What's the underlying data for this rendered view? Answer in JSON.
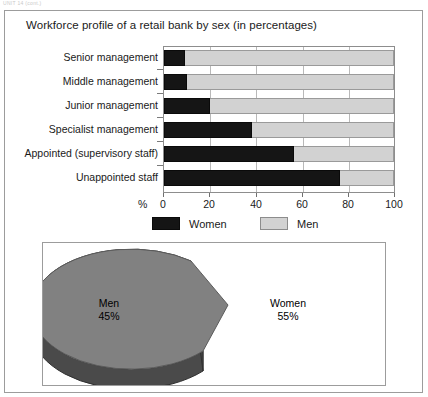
{
  "page": {
    "cut_off_header": "UNIT 14 (cont.)"
  },
  "figure": {
    "title": "Workforce profile of a retail bank by sex (in percentages)"
  },
  "chart_data": [
    {
      "type": "bar",
      "orientation": "horizontal",
      "stacked": true,
      "title": "Workforce profile of a retail bank by sex (in percentages)",
      "xlabel": "%",
      "ylabel": "",
      "xlim": [
        0,
        100
      ],
      "xticks": [
        0,
        20,
        40,
        60,
        80,
        100
      ],
      "xtick_labels": [
        "0",
        "20",
        "40",
        "60",
        "80",
        "100"
      ],
      "grid": true,
      "legend_position": "bottom",
      "categories": [
        "Senior management",
        "Middle management",
        "Junior management",
        "Specialist management",
        "Appointed (supervisory staff)",
        "Unappointed staff"
      ],
      "series": [
        {
          "name": "Women",
          "color": "#151515",
          "values": [
            9,
            10,
            20,
            38,
            56,
            76
          ]
        },
        {
          "name": "Men",
          "color": "#d2d2d2",
          "values": [
            91,
            90,
            80,
            62,
            44,
            24
          ]
        }
      ]
    },
    {
      "type": "pie",
      "title": "",
      "exploded": true,
      "three_d": true,
      "labels": [
        "Men",
        "Women"
      ],
      "values": [
        45,
        55
      ],
      "value_labels": [
        "45%",
        "55%"
      ],
      "colors": [
        "#d2d2d2",
        "#808080"
      ],
      "side_colors": [
        "#555555",
        "#4a4a4a"
      ]
    }
  ],
  "bar_chart": {
    "percent_symbol": "%",
    "rows": [
      {
        "label": "Senior management",
        "women": 9,
        "men": 91
      },
      {
        "label": "Middle management",
        "women": 10,
        "men": 90
      },
      {
        "label": "Junior management",
        "women": 20,
        "men": 80
      },
      {
        "label": "Specialist management",
        "women": 38,
        "men": 62
      },
      {
        "label": "Appointed (supervisory staff)",
        "women": 56,
        "men": 44
      },
      {
        "label": "Unappointed staff",
        "women": 76,
        "men": 24
      }
    ],
    "xtick_labels": [
      "0",
      "20",
      "40",
      "60",
      "80",
      "100"
    ],
    "legend": [
      {
        "label": "Women",
        "color": "#151515"
      },
      {
        "label": "Men",
        "color": "#d2d2d2"
      }
    ]
  },
  "pie_chart": {
    "slices": [
      {
        "name": "Men",
        "label": "Men",
        "percent_label": "45%",
        "value": 45,
        "color": "#d2d2d2"
      },
      {
        "name": "Women",
        "label": "Women",
        "percent_label": "55%",
        "value": 55,
        "color": "#808080"
      }
    ]
  }
}
